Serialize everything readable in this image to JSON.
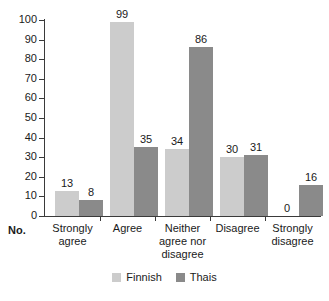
{
  "chart_data": {
    "type": "bar",
    "title": "",
    "subtitle": "",
    "xlabel": "",
    "ylabel": "No.",
    "ylim": [
      0,
      100
    ],
    "ytick_step": 10,
    "yticks": [
      0,
      10,
      20,
      30,
      40,
      50,
      60,
      70,
      80,
      90,
      100
    ],
    "ytick_labels": [
      "0",
      "10",
      "20",
      "30",
      "40",
      "50",
      "60",
      "70",
      "80",
      "90",
      "100"
    ],
    "grid": false,
    "legend_position": "bottom-center",
    "categories": [
      "Strongly agree",
      "Agree",
      "Neither agree nor disagree",
      "Disagree",
      "Strongly disagree"
    ],
    "category_label_lines": [
      [
        "Strongly",
        "agree"
      ],
      [
        "Agree"
      ],
      [
        "Neither",
        "agree nor",
        "disagree"
      ],
      [
        "Disagree"
      ],
      [
        "Strongly",
        "disagree"
      ]
    ],
    "series": [
      {
        "name": "Finnish",
        "color": "#cccccc",
        "values": [
          13,
          99,
          34,
          30,
          0
        ],
        "value_labels": [
          "13",
          "99",
          "34",
          "30",
          "0"
        ]
      },
      {
        "name": "Thais",
        "color": "#8a8a8a",
        "values": [
          8,
          35,
          86,
          31,
          16
        ],
        "value_labels": [
          "8",
          "35",
          "86",
          "31",
          "16"
        ]
      }
    ]
  },
  "legend": {
    "items": [
      {
        "label": "Finnish",
        "color": "#cccccc"
      },
      {
        "label": "Thais",
        "color": "#8a8a8a"
      }
    ]
  },
  "axis": {
    "y_title": "No."
  },
  "colors": {
    "finnish": "#cccccc",
    "thais": "#8a8a8a",
    "axis": "#3a3a3a",
    "text": "#1a1a1a",
    "background": "#ffffff"
  }
}
